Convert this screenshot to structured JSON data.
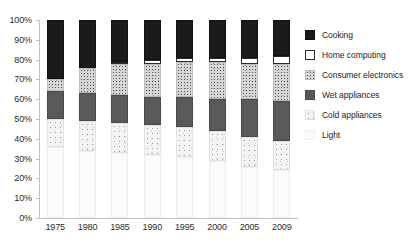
{
  "chart_data": {
    "type": "bar",
    "subtype": "stacked-100-percent",
    "title": "",
    "xlabel": "",
    "ylabel": "",
    "categories": [
      "1975",
      "1980",
      "1985",
      "1990",
      "1995",
      "2000",
      "2005",
      "2009"
    ],
    "ylim": [
      0,
      100
    ],
    "ytick_labels": [
      "0%",
      "10%",
      "20%",
      "30%",
      "40%",
      "50%",
      "60%",
      "70%",
      "80%",
      "90%",
      "100%"
    ],
    "ytick_values": [
      0,
      10,
      20,
      30,
      40,
      50,
      60,
      70,
      80,
      90,
      100
    ],
    "grid": false,
    "legend_position": "right",
    "stack_order_bottom_to_top": [
      "Light",
      "Cold appliances",
      "Wet appliances",
      "Consumer electronics",
      "Home computing",
      "Cooking"
    ],
    "series": [
      {
        "name": "Light",
        "values": [
          36,
          34,
          33,
          32,
          31,
          29,
          26,
          24
        ]
      },
      {
        "name": "Cold appliances",
        "values": [
          14,
          15,
          15,
          15,
          15,
          15,
          15,
          15
        ]
      },
      {
        "name": "Wet appliances",
        "values": [
          14,
          14,
          14,
          14,
          15,
          16,
          19,
          20
        ]
      },
      {
        "name": "Consumer electronics",
        "values": [
          6,
          13,
          16,
          17,
          18,
          19,
          18,
          19
        ]
      },
      {
        "name": "Home computing",
        "values": [
          0,
          0,
          1,
          2,
          2,
          2,
          3,
          4
        ]
      },
      {
        "name": "Cooking",
        "values": [
          30,
          24,
          21,
          20,
          19,
          19,
          19,
          18
        ]
      }
    ],
    "legend": [
      {
        "label": "Cooking",
        "swatch": "solid-black",
        "color": "#1b1b1b"
      },
      {
        "label": "Home computing",
        "swatch": "outlined-white",
        "color": "#ffffff"
      },
      {
        "label": "Consumer electronics",
        "swatch": "speckled-medium",
        "color": "#d8d8d8"
      },
      {
        "label": "Wet appliances",
        "swatch": "solid-dark-gray",
        "color": "#595959"
      },
      {
        "label": "Cold appliances",
        "swatch": "speckled-light",
        "color": "#f3f3f3"
      },
      {
        "label": "Light",
        "swatch": "near-white",
        "color": "#fbfbfb"
      }
    ]
  }
}
